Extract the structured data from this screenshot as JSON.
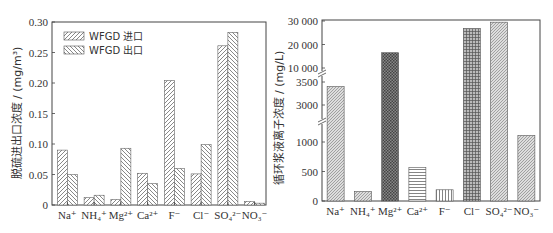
{
  "chart_data": [
    {
      "type": "bar",
      "title": "",
      "xlabel": "",
      "ylabel": "脱硫进出口浓度 / (mg/m³)",
      "ylim": [
        0,
        0.3
      ],
      "yticks": [
        "0",
        "0.05",
        "0.10",
        "0.15",
        "0.20",
        "0.25",
        "0.30"
      ],
      "categories": [
        "Na⁺",
        "NH₄⁺",
        "Mg²⁺",
        "Ca²⁺",
        "F⁻",
        "Cl⁻",
        "SO₄²⁻",
        "NO₃⁻"
      ],
      "series": [
        {
          "name": "WFGD 进口",
          "values": [
            0.09,
            0.012,
            0.009,
            0.052,
            0.204,
            0.051,
            0.261,
            0.006
          ]
        },
        {
          "name": "WFGD 出口",
          "values": [
            0.05,
            0.016,
            0.093,
            0.035,
            0.06,
            0.099,
            0.283,
            0.003
          ]
        }
      ],
      "legend_position": "upper-left",
      "grid": false
    },
    {
      "type": "bar",
      "title": "",
      "xlabel": "",
      "ylabel": "循环浆液离子浓度 / (mg/L)",
      "axis_breaks": true,
      "yticks": [
        "0",
        "500",
        "1000",
        "3000",
        "3500",
        "10 000",
        "20 000",
        "30 000"
      ],
      "categories": [
        "Na⁺",
        "NH₄⁺",
        "Mg²⁺",
        "Ca²⁺",
        "F⁻",
        "Cl⁻",
        "SO₄²⁻",
        "NO₃⁻"
      ],
      "values": [
        3400,
        160,
        16500,
        570,
        190,
        26800,
        29500,
        1350
      ],
      "grid": false
    }
  ]
}
